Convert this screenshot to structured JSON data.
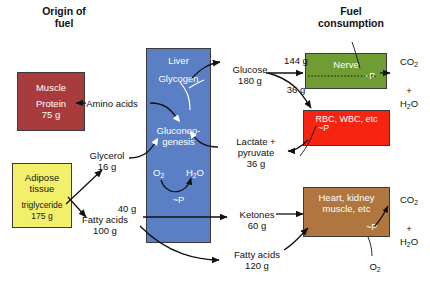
{
  "headers": {
    "left": "Origin of\nfuel",
    "right": "Fuel\nconsumption"
  },
  "organs": [
    {
      "key": "muscle",
      "name": "Muscle",
      "detail": "Protein\n75 g",
      "color": "#a83c3c",
      "text": "white"
    },
    {
      "key": "adipose",
      "name": "Adipose\ntissue",
      "detail": "triglyceride\n175 g",
      "color": "#f2ef6a",
      "text": "dark"
    },
    {
      "key": "liver",
      "name": "Liver",
      "detail": "",
      "color": "#5a7fc4",
      "text": "white"
    },
    {
      "key": "nerve",
      "name": "Nerve",
      "detail": "",
      "color": "#6f9c33",
      "text": "white"
    },
    {
      "key": "rbc",
      "name": "RBC, WBC, etc",
      "detail": "",
      "color": "#f72412",
      "text": "white"
    },
    {
      "key": "heart",
      "name": "Heart, kidney\nmuscle, etc",
      "detail": "",
      "color": "#b0763f",
      "text": "white"
    }
  ],
  "liver_text": {
    "glycogen": "Glycogen",
    "gluconeogenesis": "Gluconeo-\ngenesis",
    "o2": "O2",
    "h2o": "H2O",
    "atp": "~P"
  },
  "metabolites": {
    "amino_acids": "Amino acids",
    "glycerol": "Glycerol\n16 g",
    "fatty_acids_portal": "Fatty acids\n100 g",
    "fatty_acids_40": "40 g",
    "glucose": "Glucose\n180 g",
    "glucose_to_nerve": "144 g",
    "glucose_to_rbc": "36 g",
    "lactate_pyruvate": "Lactate +\npyruvate\n36 g",
    "ketones": "Ketones\n60 g",
    "fatty_acids_peripheral": "Fatty acids\n120 g"
  },
  "products": {
    "nerve_out": "CO2\n+\nH2O",
    "heart_out": "CO2\n+\nH2O",
    "heart_o2": "O2"
  },
  "atp_labels": {
    "nerve": "~P",
    "rbc": "~P",
    "heart": "~P"
  },
  "colors": {
    "muscle": "#a83c3c",
    "adipose": "#f2ef6a",
    "liver": "#5a7fc4",
    "nerve": "#6f9c33",
    "rbc": "#f72412",
    "heart": "#b0763f",
    "arrow": "#111111",
    "background": "#ffffff"
  }
}
